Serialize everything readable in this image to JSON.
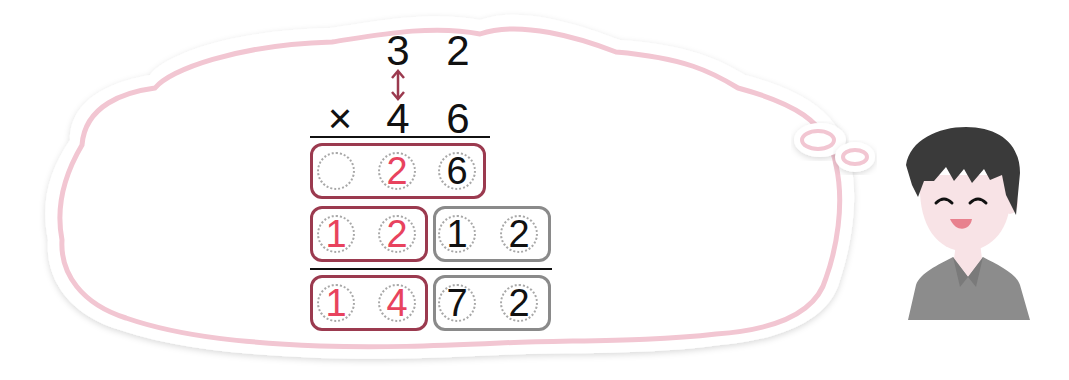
{
  "problem": {
    "multiplicand": [
      "3",
      "2"
    ],
    "multiplier": [
      "4",
      "6"
    ],
    "operator": "×"
  },
  "partial_products": [
    {
      "cells": [
        "",
        "2",
        "6"
      ],
      "colors": [
        "#e8435e",
        "#e8435e",
        "#111111"
      ]
    },
    {
      "cells": [
        "1",
        "2",
        "1",
        "2"
      ],
      "colors": [
        "#e8435e",
        "#e8435e",
        "#111111",
        "#111111"
      ]
    }
  ],
  "result": {
    "cells": [
      "1",
      "4",
      "7",
      "2"
    ],
    "colors": [
      "#e8435e",
      "#e8435e",
      "#111111",
      "#111111"
    ]
  },
  "colors": {
    "highlight_digit": "#e8435e",
    "regular_digit": "#111111",
    "red_box": "#9b3a4f",
    "gray_box": "#8a8a8a",
    "bubble_outline": "#f2c6d2",
    "arrow": "#9b3a4f",
    "hair": "#3a3a3a",
    "skin": "#f8e3e6",
    "shirt": "#8c8c8c"
  },
  "character": {
    "expression": "smiling-laughing"
  }
}
